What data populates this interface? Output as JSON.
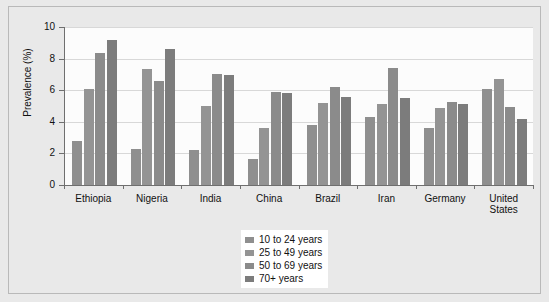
{
  "chart_data": {
    "type": "bar",
    "title": "",
    "subtitle": "",
    "xlabel": "",
    "ylabel": "Prevalence (%)",
    "ylim": [
      0,
      10
    ],
    "yticks": [
      0,
      2,
      4,
      6,
      8,
      10
    ],
    "ytick_labels": [
      "0",
      "2",
      "4",
      "6",
      "8",
      "10"
    ],
    "grid": "horizontal",
    "legend_position": "bottom-center",
    "categories": [
      "Ethiopia",
      "Nigeria",
      "India",
      "China",
      "Brazil",
      "Iran",
      "Germany",
      "United States"
    ],
    "series": [
      {
        "name": "10 to 24 years",
        "color": "#8f8f8f",
        "values": [
          2.8,
          2.25,
          2.2,
          1.65,
          3.8,
          4.3,
          3.6,
          6.05
        ]
      },
      {
        "name": "25 to 49 years",
        "color": "#949494",
        "values": [
          6.1,
          7.35,
          5.0,
          3.6,
          5.2,
          5.1,
          4.9,
          6.7
        ]
      },
      {
        "name": "50 to 69 years",
        "color": "#8b8b8b",
        "values": [
          8.35,
          6.6,
          7.05,
          5.9,
          6.2,
          7.4,
          5.25,
          4.95
        ]
      },
      {
        "name": "70+ years",
        "color": "#7c7c7c",
        "values": [
          9.15,
          8.6,
          6.95,
          5.85,
          5.55,
          5.5,
          5.15,
          4.15
        ]
      }
    ]
  },
  "legend": {
    "entries": [
      "10 to 24 years",
      "25 to 49 years",
      "50 to 69 years",
      "70+ years"
    ]
  },
  "colors": {
    "page_background": "#e9e9e9",
    "panel_background": "#fcfcfc",
    "axis": "#6f6f6f",
    "gridline": "#d8d8d8",
    "border": "#b9b9b9",
    "text": "#111111",
    "legend_background": "#ffffff"
  }
}
